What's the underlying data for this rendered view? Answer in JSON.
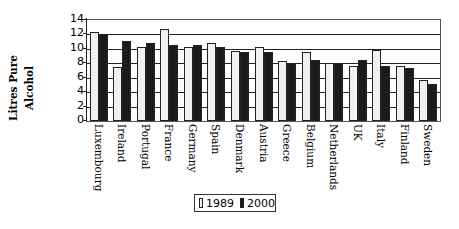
{
  "chart_data": {
    "type": "bar",
    "title": "",
    "xlabel": "",
    "ylabel": "Litres Pure Alcohol",
    "ylim": [
      0,
      14
    ],
    "yticks": [
      0,
      2,
      4,
      6,
      8,
      10,
      12,
      14
    ],
    "grid": true,
    "legend_position": "bottom",
    "categories": [
      "Luxembourg",
      "Ireland",
      "Portugal",
      "France",
      "Germany",
      "Spain",
      "Denmark",
      "Austria",
      "Greece",
      "Belgium",
      "Netherlands",
      "UK",
      "Italy",
      "Finland",
      "Sweden"
    ],
    "series": [
      {
        "name": "1989",
        "color": "#f0f0f0",
        "values": [
          12.4,
          7.5,
          10.3,
          12.8,
          10.3,
          10.8,
          9.7,
          10.3,
          8.3,
          9.5,
          8.1,
          7.6,
          9.9,
          7.6,
          5.7
        ]
      },
      {
        "name": "2000",
        "color": "#1a1a1a",
        "values": [
          12.1,
          11.1,
          10.8,
          10.6,
          10.5,
          10.2,
          9.6,
          9.6,
          8.0,
          8.5,
          8.1,
          8.4,
          7.6,
          7.3,
          5.2
        ]
      }
    ]
  },
  "ylabel_lines": [
    "Litres Pure",
    "Alcohol"
  ],
  "legend": {
    "s1": "1989",
    "s2": "2000"
  }
}
